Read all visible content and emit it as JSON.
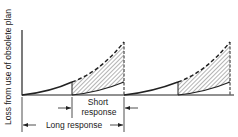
{
  "diagram": {
    "y_axis_label": "Loss from use of obsolete plan",
    "short_response_line1": "Short",
    "short_response_line2": "response",
    "long_response_label": "Long response",
    "colors": {
      "stroke": "#222222",
      "hatch": "#444444",
      "background": "#ffffff"
    }
  }
}
